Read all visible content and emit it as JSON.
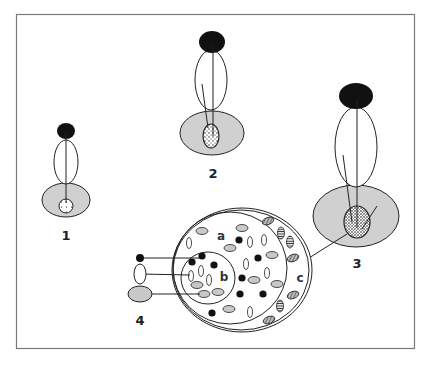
{
  "figure": {
    "frame": {
      "x": 16,
      "y": 14,
      "width": 398,
      "height": 334,
      "stroke": "#7a7a7a"
    },
    "colors": {
      "outline": "#222222",
      "black_fill": "#111111",
      "grey_fill": "#d0d0d0",
      "light_grey_fill": "#c8c8c8",
      "hatch": "#555555"
    },
    "stages": [
      {
        "id": "1",
        "label": "1"
      },
      {
        "id": "2",
        "label": "2"
      },
      {
        "id": "3",
        "label": "3"
      },
      {
        "id": "4",
        "label": "4"
      }
    ],
    "section_labels": {
      "a": "a",
      "b": "b",
      "c": "c"
    }
  }
}
